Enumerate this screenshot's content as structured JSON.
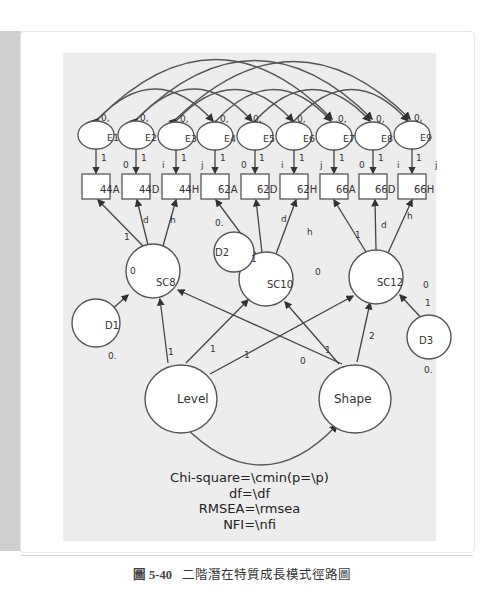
{
  "figure": {
    "caption_number": "圖 5-40",
    "caption_text": "二階潛在特質成長模式徑路圖"
  },
  "fit_indices": {
    "line1": "Chi-square=\\cmin(p=\\p)",
    "line2": "df=\\df",
    "line3": "RMSEA=\\rmsea",
    "line4": "NFI=\\nfi"
  },
  "errors": [
    {
      "id": "E1",
      "label": "E1",
      "var": "0,"
    },
    {
      "id": "E2",
      "label": "E2",
      "var": "0,"
    },
    {
      "id": "E3",
      "label": "E3",
      "var": "0,"
    },
    {
      "id": "E4",
      "label": "E4",
      "var": "0,"
    },
    {
      "id": "E5",
      "label": "E5",
      "var": "0,"
    },
    {
      "id": "E6",
      "label": "E6",
      "var": "0,"
    },
    {
      "id": "E7",
      "label": "E7",
      "var": "0,"
    },
    {
      "id": "E8",
      "label": "E8",
      "var": "0,"
    },
    {
      "id": "E9",
      "label": "E9",
      "var": "0,"
    }
  ],
  "observed": [
    {
      "label": "44A",
      "intercept": ""
    },
    {
      "label": "44D",
      "intercept": "0"
    },
    {
      "label": "44H",
      "intercept": "i"
    },
    {
      "label": "62A",
      "intercept": "j"
    },
    {
      "label": "62D",
      "intercept": "0"
    },
    {
      "label": "62H",
      "intercept": "i"
    },
    {
      "label": "66A",
      "intercept": "j"
    },
    {
      "label": "66D",
      "intercept": "0"
    },
    {
      "label": "66H",
      "intercept": "i"
    }
  ],
  "extra_intercept": "j",
  "error_loadings": "1",
  "first_order": [
    {
      "label": "SC8",
      "mean": "0",
      "loadings": [
        "1",
        "d",
        "h"
      ]
    },
    {
      "label": "SC10",
      "mean": "0",
      "loadings": [
        "1",
        "d",
        "h"
      ]
    },
    {
      "label": "SC12",
      "mean": "0",
      "loadings": [
        "1",
        "d",
        "h"
      ]
    }
  ],
  "disturbances": [
    {
      "label": "D1",
      "var": "0."
    },
    {
      "label": "D2",
      "var": "0."
    },
    {
      "label": "D3",
      "var": "0."
    }
  ],
  "disturbance_loading": "1",
  "second_order": [
    {
      "label": "Level",
      "loadings": [
        "1",
        "1",
        "1"
      ]
    },
    {
      "label": "Shape",
      "loadings": [
        "0",
        "1",
        "2"
      ]
    }
  ]
}
